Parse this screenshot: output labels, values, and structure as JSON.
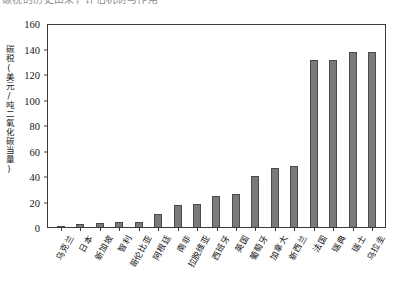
{
  "cutoff_text": "碳税的历史由来，评估机制与作用",
  "chart_data": {
    "type": "bar",
    "title": "",
    "subtitle": "",
    "xlabel": "",
    "ylabel": "碳税(美元/吨二氧化碳当量)",
    "ylim": [
      0,
      160
    ],
    "yticks": [
      0,
      20,
      40,
      60,
      80,
      100,
      120,
      140,
      160
    ],
    "ytick_labels": [
      "0",
      "20",
      "40",
      "60",
      "80",
      "100",
      "120",
      "140",
      "160"
    ],
    "grid": false,
    "legend": null,
    "bar_color": "#7a7a7a",
    "bar_edge_color": "#4a4a4a",
    "axis_color": "#3a3a3a",
    "categories": [
      "乌克兰",
      "日本",
      "新加坡",
      "智利",
      "哥伦比亚",
      "阿根廷",
      "南非",
      "拉脱维亚",
      "西班牙",
      "英国",
      "葡萄牙",
      "加拿大",
      "新西兰",
      "法国",
      "瑞典",
      "瑞士",
      "乌拉圭"
    ],
    "values": [
      1,
      2,
      3,
      4,
      4,
      10,
      17,
      18,
      24,
      26,
      40,
      46,
      48,
      131,
      131,
      137,
      137
    ],
    "series": [
      {
        "name": "碳税税率",
        "values": [
          1,
          2,
          3,
          4,
          4,
          10,
          17,
          18,
          24,
          26,
          40,
          46,
          48,
          131,
          131,
          137,
          137
        ]
      }
    ],
    "annotations": []
  }
}
